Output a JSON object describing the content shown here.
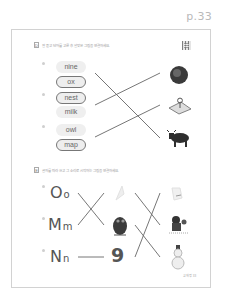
{
  "page_label": "p.33",
  "section_d": {
    "badge": "D",
    "instruction": "잘 듣고 단어를 고른 후 알맞은 그림을 연결하세요.",
    "qr_icon": "qr-code-icon",
    "groups": [
      {
        "number": "1",
        "options": [
          {
            "word": "nine",
            "circled": false
          },
          {
            "word": "ox",
            "circled": true
          }
        ]
      },
      {
        "number": "2",
        "options": [
          {
            "word": "nest",
            "circled": true
          },
          {
            "word": "milk",
            "circled": false
          }
        ]
      },
      {
        "number": "3",
        "options": [
          {
            "word": "owl",
            "circled": false
          },
          {
            "word": "map",
            "circled": true
          }
        ]
      }
    ],
    "pictures": [
      "nest",
      "map-with-pin",
      "ox"
    ],
    "connections": [
      {
        "from": "group-1",
        "to": "ox"
      },
      {
        "from": "group-2",
        "to": "nest"
      },
      {
        "from": "group-3",
        "to": "map-with-pin"
      }
    ]
  },
  "section_e": {
    "badge": "E",
    "instruction": "글자를 따라 쓰고 그 소리로 시작하는 그림을 연결하세요.",
    "letters": [
      {
        "upper": "O",
        "lower": "o"
      },
      {
        "upper": "M",
        "lower": "m"
      },
      {
        "upper": "N",
        "lower": "n"
      }
    ],
    "middle_pictures": [
      "ox (faint)",
      "owl",
      "9"
    ],
    "nine_label": "9",
    "right_pictures": [
      "milk (faint)",
      "mom-and-baby",
      "snowman"
    ],
    "connections": [
      {
        "from": "O",
        "to": "owl"
      },
      {
        "from": "M",
        "to": "ox"
      },
      {
        "from": "N",
        "to": "9"
      }
    ]
  },
  "footer": "교재명 33"
}
